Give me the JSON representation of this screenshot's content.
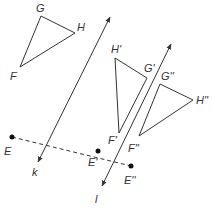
{
  "figure": {
    "stroke_color": "#333333",
    "lines": [
      {
        "name": "k",
        "label": "k"
      },
      {
        "name": "l",
        "label": "l"
      }
    ],
    "triangles": [
      {
        "name": "FGH",
        "vertices": {
          "F": "F",
          "G": "G",
          "H": "H"
        }
      },
      {
        "name": "F'G'H'",
        "vertices": {
          "F": "F'",
          "G": "G'",
          "H": "H'"
        }
      },
      {
        "name": "F''G''H''",
        "vertices": {
          "F": "F''",
          "G": "G''",
          "H": "H''"
        }
      }
    ],
    "points": [
      {
        "name": "E",
        "label": "E"
      },
      {
        "name": "E'",
        "label": "E'"
      },
      {
        "name": "E''",
        "label": "E''"
      }
    ]
  }
}
